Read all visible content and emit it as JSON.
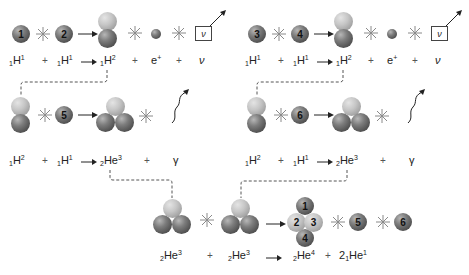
{
  "diagram": {
    "stage1_left": {
      "protons": [
        "1",
        "2"
      ],
      "equation": {
        "reactant_a": "H",
        "reactant_a_sub": "1",
        "reactant_a_sup": "1",
        "plus1": "+",
        "reactant_b": "H",
        "reactant_b_sub": "1",
        "reactant_b_sup": "1",
        "product": "H",
        "product_sub": "1",
        "product_sup": "2",
        "plus2": "+",
        "positron": "e",
        "positron_sup": "+",
        "plus3": "+",
        "neutrino": "ν"
      },
      "neutrino_box": "ν"
    },
    "stage1_right": {
      "protons": [
        "3",
        "4"
      ],
      "equation": {
        "reactant_a": "H",
        "reactant_a_sub": "1",
        "reactant_a_sup": "1",
        "plus1": "+",
        "reactant_b": "H",
        "reactant_b_sub": "1",
        "reactant_b_sup": "1",
        "product": "H",
        "product_sub": "1",
        "product_sup": "2",
        "plus2": "+",
        "positron": "e",
        "positron_sup": "+",
        "plus3": "+",
        "neutrino": "ν"
      },
      "neutrino_box": "ν"
    },
    "stage2_left": {
      "proton": "5",
      "equation": {
        "reactant_a": "H",
        "reactant_a_sub": "1",
        "reactant_a_sup": "2",
        "plus1": "+",
        "reactant_b": "H",
        "reactant_b_sub": "1",
        "reactant_b_sup": "1",
        "product": "He",
        "product_sub": "2",
        "product_sup": "3",
        "plus2": "+",
        "gamma": "γ"
      }
    },
    "stage2_right": {
      "proton": "6",
      "equation": {
        "reactant_a": "H",
        "reactant_a_sub": "1",
        "reactant_a_sup": "2",
        "plus1": "+",
        "reactant_b": "H",
        "reactant_b_sub": "1",
        "reactant_b_sup": "1",
        "product": "He",
        "product_sub": "2",
        "product_sup": "3",
        "plus2": "+",
        "gamma": "γ"
      }
    },
    "stage3": {
      "helium4_labels": [
        "1",
        "2",
        "3",
        "4"
      ],
      "released_protons": [
        "5",
        "6"
      ],
      "equation": {
        "reactant_a": "He",
        "reactant_a_sub": "2",
        "reactant_a_sup": "3",
        "plus1": "+",
        "reactant_b": "He",
        "reactant_b_sub": "2",
        "reactant_b_sup": "3",
        "product": "He",
        "product_sub": "2",
        "product_sup": "4",
        "plus2": "+",
        "coef": "2",
        "product2": "He",
        "product2_sub": "1",
        "product2_sup": "1"
      }
    },
    "colors": {
      "dark_sphere": "#5a5a5a",
      "light_sphere": "#b5b5b5",
      "dashed_line": "#555555",
      "star": "#8a8a8a"
    }
  }
}
